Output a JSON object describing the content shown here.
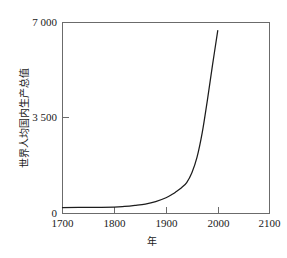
{
  "chart_data": {
    "type": "line",
    "title": "",
    "subtitle": "",
    "xlabel": "年",
    "ylabel": "世界人均国内生产总值",
    "xlim": [
      1700,
      2100
    ],
    "ylim": [
      0,
      7000
    ],
    "grid": false,
    "legend": null,
    "x_ticks": [
      "1700",
      "1800",
      "1900",
      "2000",
      "2100"
    ],
    "x_tick_values": [
      1700,
      1800,
      1900,
      2000,
      2100
    ],
    "y_ticks": [
      "0",
      "3 500",
      "7 000"
    ],
    "y_tick_values": [
      0,
      3500,
      7000
    ],
    "series": [
      {
        "name": "世界人均国内生产总值",
        "color": "#1c1c1c",
        "x": [
          1700,
          1750,
          1800,
          1820,
          1840,
          1860,
          1880,
          1900,
          1913,
          1920,
          1930,
          1940,
          1950,
          1960,
          1970,
          1980,
          1990,
          2000
        ],
        "values": [
          200,
          205,
          215,
          240,
          280,
          330,
          420,
          560,
          700,
          790,
          930,
          1120,
          1480,
          2050,
          2950,
          4150,
          5450,
          6700
        ]
      }
    ],
    "annotations": []
  },
  "axis": {
    "y_label_top": "7 000",
    "y_label_mid": "3 500",
    "y_label_zero": "0",
    "x_label_1": "1700",
    "x_label_2": "1800",
    "x_label_3": "1900",
    "x_label_4": "2000",
    "x_label_5": "2100",
    "x_title": "年",
    "y_title": "世界人均国内生产总值"
  },
  "style": {
    "background": "#ffffff",
    "line_color": "#1c1c1c",
    "frame_color": "#6b6b6b",
    "text_color": "#1a1a1a"
  }
}
